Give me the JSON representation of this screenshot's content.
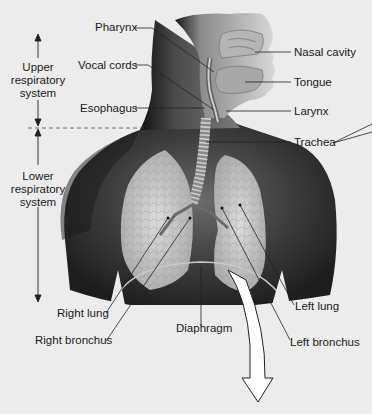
{
  "figure": {
    "regions": {
      "upper": {
        "line1": "Upper",
        "line2": "respiratory",
        "line3": "system"
      },
      "lower": {
        "line1": "Lower",
        "line2": "respiratory",
        "line3": "system"
      }
    },
    "labels": {
      "pharynx": "Pharynx",
      "vocal_cords": "Vocal cords",
      "esophagus": "Esophagus",
      "nasal_cavity": "Nasal cavity",
      "tongue": "Tongue",
      "larynx": "Larynx",
      "trachea": "Trachea",
      "right_lung": "Right lung",
      "right_bronchus": "Right bronchus",
      "diaphragm": "Diaphragm",
      "left_lung": "Left lung",
      "left_bronchus": "Left bronchus"
    },
    "colors": {
      "background": "#ececec",
      "skin_dark": "#2e2e2e",
      "skin_mid": "#5a5a5a",
      "lung": "#cfcfcf",
      "label_text": "#1a1a1a",
      "leader_line": "#222222",
      "arrow_fill": "#ffffff"
    }
  }
}
